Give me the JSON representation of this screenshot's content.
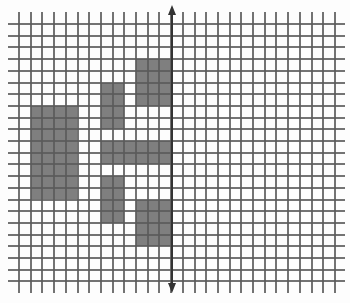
{
  "diagram": {
    "type": "grid-with-shaded-blocks",
    "grid": {
      "origin_x": 19,
      "origin_y": 24,
      "cell_size": 11.7,
      "columns": 27,
      "rows": 22,
      "vline_top": 12,
      "vline_bottom": 293,
      "hline_left": 8,
      "hline_right": 345,
      "line_color": "#5a5a5a"
    },
    "block_color": "#7f7f7f",
    "blocks": [
      {
        "name": "block-large-left",
        "col": 1,
        "row": 7,
        "w": 4,
        "h": 8
      },
      {
        "name": "block-left-upper",
        "col": 7,
        "row": 5,
        "w": 2,
        "h": 4
      },
      {
        "name": "block-right-upper",
        "col": 10,
        "row": 3,
        "w": 3,
        "h": 4
      },
      {
        "name": "block-horizontal-bar",
        "col": 7,
        "row": 10,
        "w": 6,
        "h": 2
      },
      {
        "name": "block-left-lower",
        "col": 7,
        "row": 13,
        "w": 2,
        "h": 4
      },
      {
        "name": "block-right-lower",
        "col": 10,
        "row": 15,
        "w": 3,
        "h": 4
      }
    ],
    "axis": {
      "orientation": "vertical",
      "x": 172,
      "top": 5,
      "bottom": 293,
      "arrowheads": [
        "up",
        "down"
      ],
      "color": "#333333"
    }
  }
}
